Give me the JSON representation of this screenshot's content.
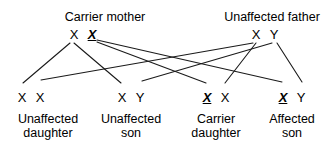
{
  "diagram": {
    "type": "x-linked-recessive-inheritance-cross",
    "background_color": "#ffffff",
    "line_color": "#1a1a1a",
    "text_color": "#000000"
  },
  "parents": [
    {
      "id": "mother",
      "title": "Carrier mother",
      "title_x": 105,
      "title_y": 10,
      "alleles_x": 83,
      "alleles_y": 28,
      "alleles": [
        {
          "symbol": "X",
          "mutant": false,
          "x": 72
        },
        {
          "symbol": "X",
          "mutant": true,
          "x": 93
        }
      ]
    },
    {
      "id": "father",
      "title": "Unaffected father",
      "title_x": 272,
      "title_y": 10,
      "alleles_x": 265,
      "alleles_y": 28,
      "alleles": [
        {
          "symbol": "X",
          "mutant": false,
          "x": 255
        },
        {
          "symbol": "Y",
          "mutant": false,
          "x": 274
        }
      ]
    }
  ],
  "offspring": [
    {
      "id": "unaffected-daughter",
      "label_line1": "Unaffected",
      "label_line2": "daughter",
      "label_x": 48,
      "label_y": 113,
      "alleles_x": 31,
      "alleles_y": 91,
      "alleles": [
        {
          "symbol": "X",
          "mutant": false,
          "x": 22
        },
        {
          "symbol": "X",
          "mutant": false,
          "x": 40
        }
      ]
    },
    {
      "id": "unaffected-son",
      "label_line1": "Unaffected",
      "label_line2": "son",
      "label_x": 131,
      "label_y": 113,
      "alleles_x": 131,
      "alleles_y": 91,
      "alleles": [
        {
          "symbol": "X",
          "mutant": false,
          "x": 122
        },
        {
          "symbol": "Y",
          "mutant": false,
          "x": 140
        }
      ]
    },
    {
      "id": "carrier-daughter",
      "label_line1": "Carrier",
      "label_line2": "daughter",
      "label_x": 216,
      "label_y": 113,
      "alleles_x": 216,
      "alleles_y": 91,
      "alleles": [
        {
          "symbol": "X",
          "mutant": true,
          "x": 207
        },
        {
          "symbol": "X",
          "mutant": false,
          "x": 224
        }
      ]
    },
    {
      "id": "affected-son",
      "label_line1": "Affected",
      "label_line2": "son",
      "label_x": 292,
      "label_y": 113,
      "alleles_x": 292,
      "alleles_y": 91,
      "alleles": [
        {
          "symbol": "X",
          "mutant": true,
          "x": 283
        },
        {
          "symbol": "Y",
          "mutant": false,
          "x": 301
        }
      ]
    }
  ],
  "inheritance_lines": [
    {
      "from": "mother.X",
      "to": "unaffected-daughter.X1",
      "x1": 70,
      "y1": 43,
      "x2": 23,
      "y2": 83
    },
    {
      "from": "mother.X",
      "to": "unaffected-son.X",
      "x1": 74,
      "y1": 43,
      "x2": 121,
      "y2": 83
    },
    {
      "from": "mother.X-mutant",
      "to": "carrier-daughter.X",
      "x1": 97,
      "y1": 42,
      "x2": 206,
      "y2": 83
    },
    {
      "from": "mother.X-mutant",
      "to": "affected-son.X",
      "x1": 97,
      "y1": 40,
      "x2": 282,
      "y2": 82
    },
    {
      "from": "father.X",
      "to": "unaffected-daughter.X2",
      "x1": 253,
      "y1": 43,
      "x2": 41,
      "y2": 80
    },
    {
      "from": "father.X",
      "to": "carrier-daughter.X2",
      "x1": 256,
      "y1": 43,
      "x2": 225,
      "y2": 83
    },
    {
      "from": "father.Y",
      "to": "unaffected-son.Y",
      "x1": 272,
      "y1": 43,
      "x2": 142,
      "y2": 81
    },
    {
      "from": "father.Y",
      "to": "affected-son.Y",
      "x1": 277,
      "y1": 43,
      "x2": 302,
      "y2": 82
    }
  ]
}
